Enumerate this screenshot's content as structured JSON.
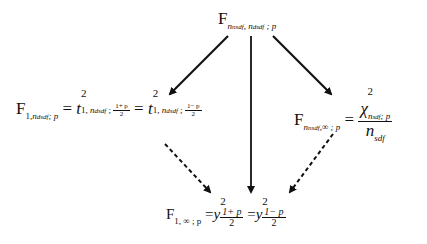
{
  "diagram": {
    "top": {
      "base": "F",
      "sub": "n_nsdf, n_dsdf ; p",
      "sub_a": "n",
      "sub_a_idx": "nsdf",
      "sub_b": "n",
      "sub_b_idx": "dsdf",
      "sub_c": "p"
    },
    "left": {
      "base": "F",
      "sub_one": "1,",
      "sub_n": "n",
      "sub_n_idx": "dsdf",
      "sub_p": "; p",
      "eq1": "=",
      "t1": "t",
      "t1_sup": "2",
      "t1_sub_one": "1,",
      "t1_sub_n": "n",
      "t1_sub_n_idx": "dsdf",
      "t1_frac_num": "1+ p",
      "t1_frac_den": "2",
      "eq2": "=",
      "t2": "t",
      "t2_sup": "2",
      "t2_sub_one": "1,",
      "t2_sub_n": "n",
      "t2_sub_n_idx": "dsdf",
      "t2_frac_num": "1− p",
      "t2_frac_den": "2"
    },
    "right": {
      "base": "F",
      "sub_n": "n",
      "sub_n_idx": "nsdf",
      "sub_rest": ",∞ ; p",
      "eq": "=",
      "chi": "χ",
      "chi_sup": "2",
      "chi_sub_n": "n",
      "chi_sub_n_idx": "sdf",
      "chi_sub_p": "; p",
      "den_n": "n",
      "den_idx": "sdf"
    },
    "bottom": {
      "base": "F",
      "sub": "1, ∞ ; p",
      "eq1": "=",
      "y1": "y",
      "y1_sup": "2",
      "y1_frac_num": "1+ p",
      "y1_frac_den": "2",
      "eq2": "=",
      "y2": "y",
      "y2_sup": "2",
      "y2_frac_num": "1− p",
      "y2_frac_den": "2"
    },
    "edges": [
      {
        "from": "top",
        "to": "left",
        "style": "solid"
      },
      {
        "from": "top",
        "to": "bottom",
        "style": "solid"
      },
      {
        "from": "top",
        "to": "right",
        "style": "solid"
      },
      {
        "from": "left",
        "to": "bottom",
        "style": "dashed"
      },
      {
        "from": "right",
        "to": "bottom",
        "style": "dashed"
      }
    ]
  }
}
